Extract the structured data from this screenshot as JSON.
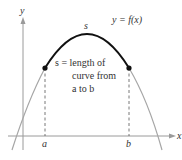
{
  "diagram": {
    "function_label": "y = f(x)",
    "arc_label": "s",
    "annotation": {
      "line1": "s = length of",
      "line2": "curve from",
      "line3": "a to b"
    },
    "axes": {
      "x_label": "x",
      "y_label": "y"
    },
    "points": {
      "left_label": "a",
      "right_label": "b"
    },
    "colors": {
      "arc": "#111111",
      "curve": "#a6a6a6",
      "axes": "#9a9a9a",
      "text": "#333333"
    }
  }
}
